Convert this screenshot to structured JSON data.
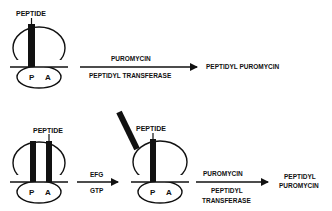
{
  "colors": {
    "ink": "#111111",
    "background": "#ffffff"
  },
  "top_scheme": {
    "ribosome": {
      "peptide_label": "PEPTIDE",
      "site_p": "P",
      "site_a": "A"
    },
    "arrow": {
      "above": "PUROMYCIN",
      "below": "PEPTIDYL TRANSFERASE"
    },
    "product": "PEPTIDYL PUROMYCIN"
  },
  "bottom_scheme": {
    "ribosome_1": {
      "peptide_label": "PEPTIDE",
      "site_p": "P",
      "site_a": "A"
    },
    "arrow_1": {
      "above": "EFG",
      "below": "GTP"
    },
    "ribosome_2": {
      "peptide_label": "PEPTIDE",
      "site_p": "P",
      "site_a": "A"
    },
    "arrow_2": {
      "above": "PUROMYCIN",
      "below_line1": "PEPTIDYL",
      "below_line2": "TRANSFERASE"
    },
    "product": {
      "line1": "PEPTIDYL",
      "line2": "PUROMYCIN"
    }
  }
}
